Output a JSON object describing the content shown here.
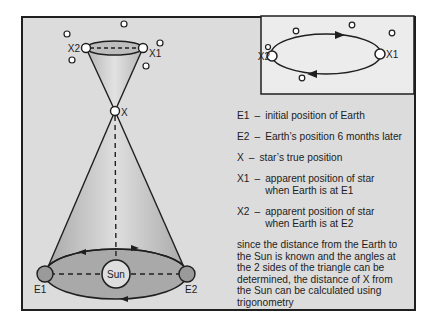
{
  "diagram": {
    "colors": {
      "background": "#dcdcdc",
      "frame": "#1f1f1f",
      "inset_background": "#ececec",
      "cone_fill": "#bdbdbd",
      "orbit_fill": "#a9a9a9",
      "earth_fill": "#9a9a9a",
      "star_fill": "#ffffff"
    },
    "main_labels": {
      "x2": "X2",
      "x1": "X1",
      "x": "X",
      "sun": "Sun",
      "e1": "E1",
      "e2": "E2"
    },
    "inset_labels": {
      "x2": "X2",
      "x1": "X1"
    }
  },
  "legend": {
    "items": [
      {
        "key": "E1",
        "desc": "initial position of Earth"
      },
      {
        "key": "E2",
        "desc": "Earth’s position 6 months later"
      },
      {
        "key": "X",
        "desc": "star’s true position"
      },
      {
        "key": "X1",
        "desc": "apparent position of star when Earth is at E1"
      },
      {
        "key": "X2",
        "desc": "apparent position of star when Earth is at E2"
      }
    ],
    "dash": "–",
    "note": "since the distance from the Earth to the Sun is known and the angles at the 2 sides of the triangle can be determined, the distance of X from the Sun can be calculated using trigonometry"
  }
}
